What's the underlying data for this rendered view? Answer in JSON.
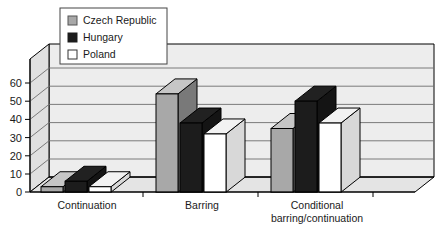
{
  "chart_data": {
    "type": "bar",
    "title": "",
    "subtitle": "",
    "xlabel": "",
    "ylabel": "",
    "categories": [
      "Continuation",
      "Barring",
      "Conditional barring/continuation"
    ],
    "category_lines": [
      [
        "Continuation"
      ],
      [
        "Barring"
      ],
      [
        "Conditional",
        "barring/continuation"
      ]
    ],
    "series": [
      {
        "name": "Czech Republic",
        "values": [
          3,
          54,
          35
        ],
        "color": "#a8a8a8"
      },
      {
        "name": "Hungary",
        "values": [
          6,
          38,
          50
        ],
        "color": "#1c1c1c"
      },
      {
        "name": "Poland",
        "values": [
          3,
          32,
          38
        ],
        "color": "#ffffff"
      }
    ],
    "ylim": [
      0,
      65
    ],
    "yticks": [
      0,
      10,
      20,
      30,
      40,
      50,
      60
    ],
    "ytick_labels": [
      "0",
      "10",
      "20",
      "30",
      "40",
      "50",
      "60"
    ],
    "grid": true,
    "grid_axis": "y",
    "legend_position": "top-left",
    "style": "3d-grouped-bars",
    "plot_bg": "#ededed",
    "wall_color": "#e4e4e4",
    "grid_color": "#6e6e6e",
    "axis_color": "#000000"
  },
  "legend": {
    "entries": [
      {
        "label": "Czech Republic",
        "swatch": "#a8a8a8"
      },
      {
        "label": "Hungary",
        "swatch": "#1c1c1c"
      },
      {
        "label": "Poland",
        "swatch": "#ffffff"
      }
    ]
  },
  "axis": {
    "y_tick_labels": [
      "60",
      "50",
      "40",
      "30",
      "20",
      "10",
      "0"
    ]
  },
  "categories": {
    "c0_line0": "Continuation",
    "c1_line0": "Barring",
    "c2_line0": "Conditional",
    "c2_line1": "barring/continuation"
  }
}
